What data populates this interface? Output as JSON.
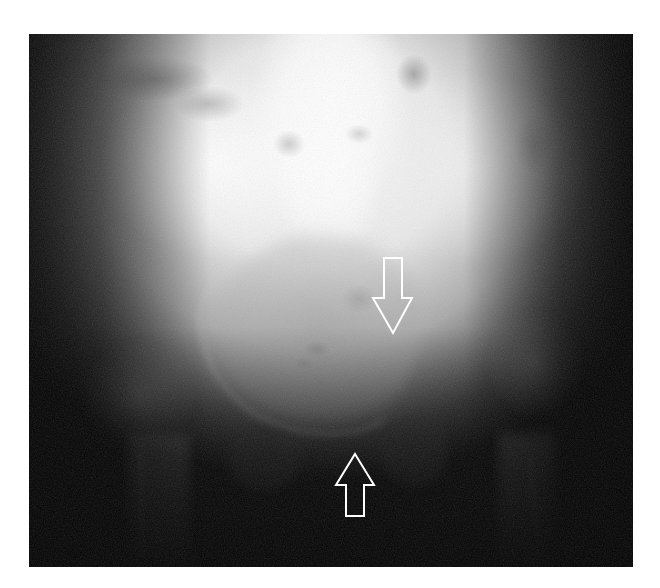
{
  "image": {
    "kind": "radiograph",
    "view": "AP pelvis",
    "frame": {
      "x": 29,
      "y": 34,
      "width": 604,
      "height": 533
    },
    "background_color": "#ffffff",
    "film_dark_color": "#050505",
    "film_bright_color": "#ffffff"
  },
  "annotations": {
    "color": "#ffffff",
    "arrows": [
      {
        "id": "arrow-down",
        "direction": "down",
        "points": "384,258 402,258 402,298 412,298 393,333 373,298 384,298"
      },
      {
        "id": "arrow-up",
        "direction": "up",
        "points": "355,454 374,485 364,485 364,516 346,516 346,485 336,485"
      }
    ]
  },
  "caption": "Pelvic radiograph with two white outline arrows indicating findings at the pubic region"
}
